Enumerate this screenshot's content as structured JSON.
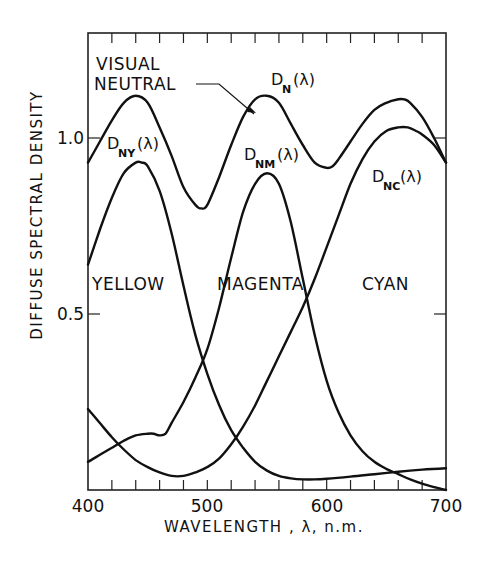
{
  "chart_data": {
    "type": "line",
    "title": "",
    "xlabel": "WAVELENGTH , λ, n.m.",
    "ylabel": "DIFFUSE SPECTRAL DENSITY",
    "xlim": [
      400,
      700
    ],
    "ylim": [
      0,
      1.3
    ],
    "x_tick_labels": [
      "400",
      "500",
      "600",
      "700"
    ],
    "x_tick_values": [
      400,
      500,
      600,
      700
    ],
    "x_minor_step": 20,
    "y_tick_labels": [
      "0.5",
      "1.0"
    ],
    "y_tick_values": [
      0.5,
      1.0
    ],
    "grid": false,
    "legend": "inline annotations",
    "annotations": [
      {
        "text": "VISUAL",
        "role": "neutral-label-line1"
      },
      {
        "text": "NEUTRAL",
        "role": "neutral-label-line2"
      },
      {
        "text": "YELLOW",
        "role": "region-label"
      },
      {
        "text": "MAGENTA",
        "role": "region-label"
      },
      {
        "text": "CYAN",
        "role": "region-label"
      }
    ],
    "series": [
      {
        "name": "D_N(λ)",
        "label_main": "D",
        "label_sub": "N",
        "label_tail": "(λ)",
        "x": [
          400,
          410,
          420,
          430,
          440,
          450,
          460,
          470,
          480,
          490,
          495,
          500,
          510,
          520,
          530,
          540,
          550,
          560,
          570,
          580,
          590,
          600,
          605,
          610,
          620,
          630,
          640,
          650,
          660,
          665,
          670,
          680,
          690,
          700
        ],
        "values": [
          0.93,
          0.99,
          1.05,
          1.1,
          1.12,
          1.1,
          1.03,
          0.95,
          0.86,
          0.81,
          0.8,
          0.81,
          0.89,
          0.98,
          1.06,
          1.11,
          1.12,
          1.1,
          1.04,
          0.98,
          0.93,
          0.915,
          0.92,
          0.94,
          0.99,
          1.04,
          1.08,
          1.1,
          1.11,
          1.11,
          1.1,
          1.06,
          1.0,
          0.93
        ]
      },
      {
        "name": "D_NY(λ)",
        "label_main": "D",
        "label_sub": "NY",
        "label_tail": "(λ)",
        "x": [
          400,
          410,
          420,
          430,
          440,
          445,
          450,
          460,
          470,
          480,
          490,
          500,
          510,
          520,
          530,
          540,
          550,
          560,
          570,
          580,
          590,
          600,
          620,
          640,
          660,
          680,
          700
        ],
        "values": [
          0.64,
          0.74,
          0.83,
          0.9,
          0.93,
          0.93,
          0.92,
          0.85,
          0.73,
          0.58,
          0.44,
          0.33,
          0.24,
          0.17,
          0.12,
          0.08,
          0.055,
          0.04,
          0.033,
          0.03,
          0.03,
          0.032,
          0.038,
          0.045,
          0.052,
          0.058,
          0.062
        ]
      },
      {
        "name": "D_NM(λ)",
        "label_main": "D",
        "label_sub": "NM",
        "label_tail": "(λ)",
        "x": [
          400,
          410,
          420,
          430,
          440,
          450,
          455,
          460,
          465,
          470,
          480,
          490,
          500,
          510,
          520,
          530,
          540,
          550,
          560,
          570,
          580,
          590,
          600,
          610,
          620,
          630,
          640,
          650,
          660,
          670,
          680,
          690,
          700
        ],
        "values": [
          0.08,
          0.1,
          0.12,
          0.14,
          0.155,
          0.16,
          0.16,
          0.155,
          0.16,
          0.19,
          0.25,
          0.32,
          0.4,
          0.52,
          0.66,
          0.79,
          0.87,
          0.9,
          0.87,
          0.76,
          0.6,
          0.44,
          0.31,
          0.22,
          0.155,
          0.11,
          0.08,
          0.06,
          0.045,
          0.03,
          0.018,
          0.008,
          0.0
        ]
      },
      {
        "name": "D_NC(λ)",
        "label_main": "D",
        "label_sub": "NC",
        "label_tail": "(λ)",
        "x": [
          400,
          410,
          420,
          430,
          440,
          450,
          460,
          470,
          480,
          490,
          500,
          510,
          520,
          530,
          540,
          550,
          560,
          570,
          580,
          590,
          600,
          610,
          620,
          630,
          640,
          650,
          660,
          668,
          675,
          680,
          690,
          700
        ],
        "values": [
          0.23,
          0.19,
          0.15,
          0.115,
          0.085,
          0.065,
          0.05,
          0.04,
          0.04,
          0.05,
          0.065,
          0.09,
          0.13,
          0.18,
          0.24,
          0.31,
          0.38,
          0.45,
          0.52,
          0.6,
          0.69,
          0.78,
          0.87,
          0.94,
          0.99,
          1.02,
          1.03,
          1.03,
          1.02,
          1.01,
          0.98,
          0.93
        ]
      }
    ]
  },
  "labels": {
    "ylabel": "DIFFUSE SPECTRAL DENSITY",
    "xlabel": "WAVELENGTH , λ, n.m.",
    "visual": "VISUAL",
    "neutral": "NEUTRAL",
    "yellow": "YELLOW",
    "magenta": "MAGENTA",
    "cyan": "CYAN",
    "dn_main": "D",
    "dn_sub": "N",
    "dny_sub": "NY",
    "dnm_sub": "NM",
    "dnc_sub": "NC",
    "lambda_tail": "(λ)",
    "x400": "400",
    "x500": "500",
    "x600": "600",
    "x700": "700",
    "y05": "0.5",
    "y10": "1.0"
  }
}
